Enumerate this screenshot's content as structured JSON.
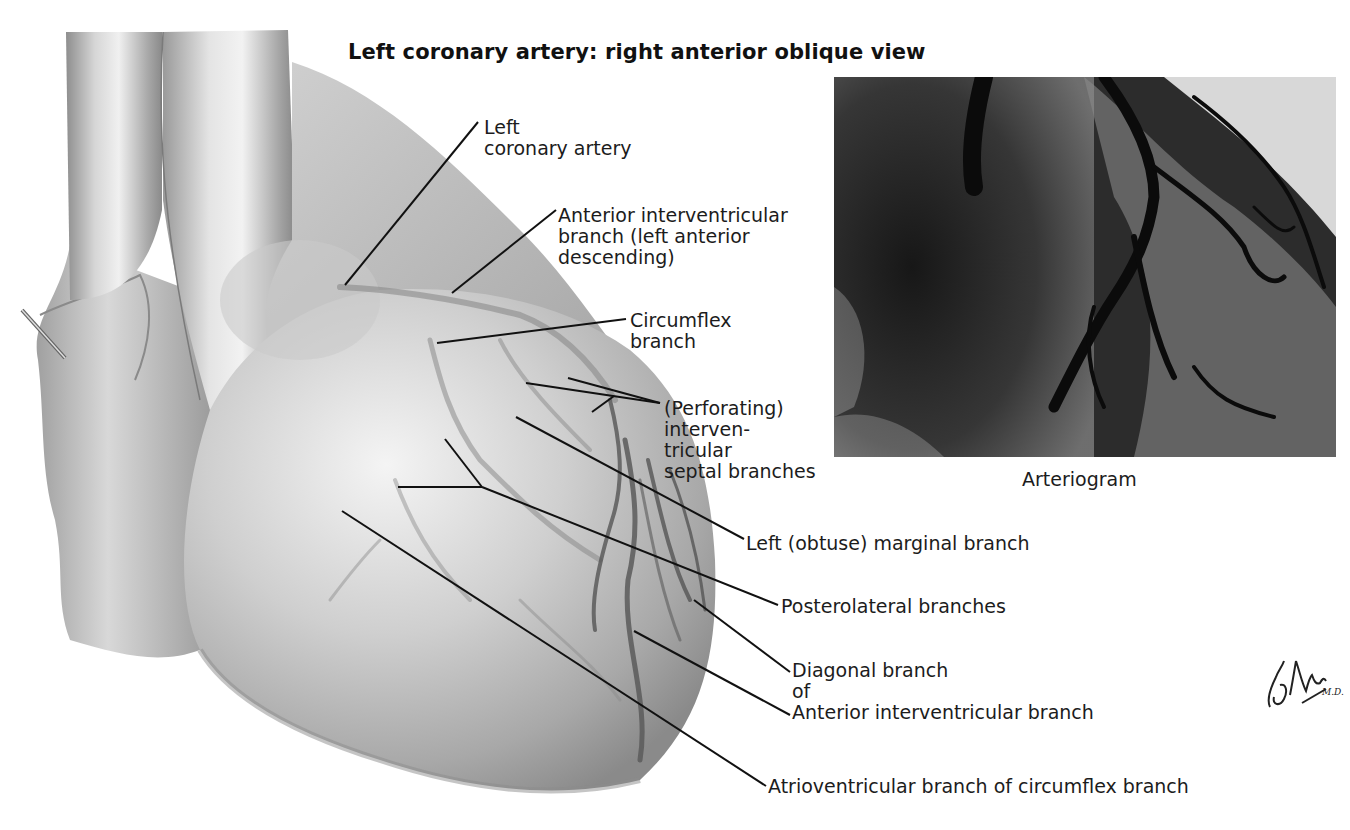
{
  "figure": {
    "title": "Left coronary artery: right anterior oblique view",
    "illustration": "heart-anterior-illustration",
    "labels": [
      {
        "id": "left-coronary-artery",
        "lines": [
          "Left",
          "coronary artery"
        ]
      },
      {
        "id": "anterior-interventricular-branch",
        "lines": [
          "Anterior interventricular",
          "branch (left anterior",
          "descending)"
        ]
      },
      {
        "id": "circumflex-branch",
        "lines": [
          "Circumflex",
          "branch"
        ]
      },
      {
        "id": "septal-branches",
        "lines": [
          "(Perforating)",
          "interven-",
          "tricular",
          "septal branches"
        ]
      },
      {
        "id": "left-marginal-branch",
        "lines": [
          "Left (obtuse) marginal branch"
        ]
      },
      {
        "id": "posterolateral-branches",
        "lines": [
          "Posterolateral branches"
        ]
      },
      {
        "id": "diagonal-branch",
        "lines": [
          "Diagonal branch",
          "of",
          "Anterior interventricular branch"
        ]
      },
      {
        "id": "atrioventricular-branch",
        "lines": [
          "Atrioventricular branch of circumflex branch"
        ]
      }
    ],
    "inset": {
      "image": "arteriogram-xray",
      "caption": "Arteriogram"
    },
    "signature": "F. Netter M.D."
  },
  "colors": {
    "background": "#ffffff",
    "text": "#1c1c1c",
    "leader_lines": "#111111",
    "heart_mid": "#b8b8b8",
    "heart_light": "#e2e2e2",
    "heart_dark": "#7a7a7a",
    "xray_dark": "#141414",
    "xray_light": "#e8e8e8"
  }
}
